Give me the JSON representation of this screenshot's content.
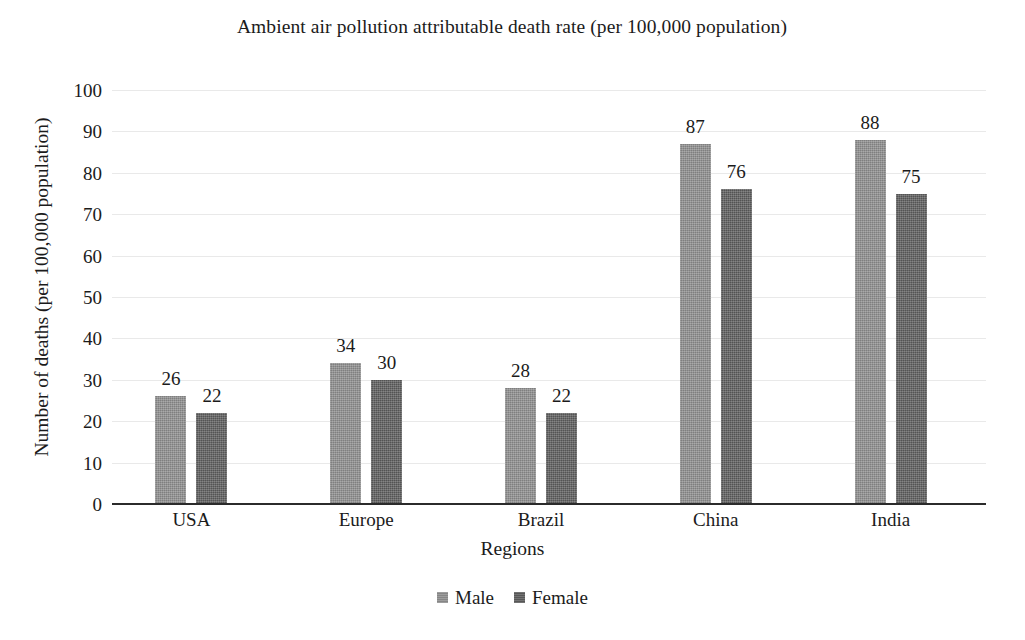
{
  "chart_data": {
    "type": "bar",
    "title": "Ambient air pollution attributable death rate (per 100,000 population)",
    "xlabel": "Regions",
    "ylabel": "Number of deaths (per 100,000 population)",
    "categories": [
      "USA",
      "Europe",
      "Brazil",
      "China",
      "India"
    ],
    "series": [
      {
        "name": "Male",
        "values": [
          26,
          34,
          28,
          87,
          88
        ],
        "color": "#8d8d8d"
      },
      {
        "name": "Female",
        "values": [
          22,
          30,
          22,
          76,
          75
        ],
        "color": "#5c5c5c"
      }
    ],
    "ylim": [
      0,
      100
    ],
    "yticks": [
      0,
      10,
      20,
      30,
      40,
      50,
      60,
      70,
      80,
      90,
      100
    ],
    "ytick_labels": [
      "0",
      "10",
      "20",
      "30",
      "40",
      "50",
      "60",
      "70",
      "80",
      "90",
      "100"
    ],
    "grid": true,
    "grid_color": "#e9e9e9",
    "legend_position": "bottom",
    "data_labels": true,
    "axis_color": "#2b2b2b",
    "text_color": "#1b1b1b",
    "background": "#ffffff"
  }
}
